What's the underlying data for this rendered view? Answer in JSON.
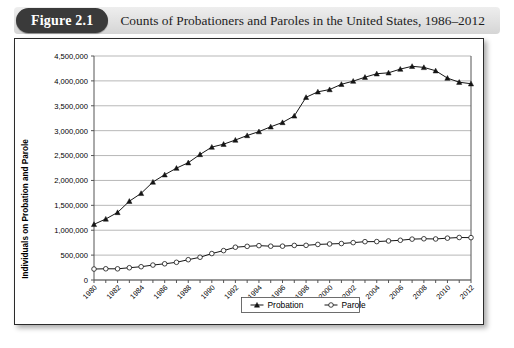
{
  "figure": {
    "badge_label": "Figure 2.1",
    "title": "Counts of Probationers and Paroles in the United States, 1986–2012"
  },
  "chart_data": {
    "type": "line",
    "xlabel": "",
    "ylabel": "Individuals on Probation and Parole",
    "ylim": [
      0,
      4500000
    ],
    "xlim": [
      1980,
      2012
    ],
    "grid": true,
    "legend_position": "bottom-center",
    "y_tick_labels": [
      "0",
      "500,000",
      "1,000,000",
      "1,500,000",
      "2,000,000",
      "2,500,000",
      "3,000,000",
      "3,500,000",
      "4,000,000",
      "4,500,000"
    ],
    "y_ticks": [
      0,
      500000,
      1000000,
      1500000,
      2000000,
      2500000,
      3000000,
      3500000,
      4000000,
      4500000
    ],
    "x": [
      1980,
      1981,
      1982,
      1983,
      1984,
      1985,
      1986,
      1987,
      1988,
      1989,
      1990,
      1991,
      1992,
      1993,
      1994,
      1995,
      1996,
      1997,
      1998,
      1999,
      2000,
      2001,
      2002,
      2003,
      2004,
      2005,
      2006,
      2007,
      2008,
      2009,
      2010,
      2011,
      2012
    ],
    "x_tick_labels": [
      "1980",
      "1982",
      "1984",
      "1986",
      "1988",
      "1990",
      "1992",
      "1994",
      "1996",
      "1998",
      "2000",
      "2002",
      "2004",
      "2006",
      "2008",
      "2010",
      "2012"
    ],
    "series": [
      {
        "name": "Probation",
        "marker": "filled-triangle",
        "values": [
          1118097,
          1225934,
          1357264,
          1582947,
          1740948,
          1968712,
          2114621,
          2247158,
          2356483,
          2522125,
          2670234,
          2728472,
          2811611,
          2903061,
          2981022,
          3077861,
          3164996,
          3296513,
          3670441,
          3779922,
          3826209,
          3931731,
          3995165,
          4073987,
          4143792,
          4162536,
          4236800,
          4293163,
          4270917,
          4203967,
          4055514,
          3973800,
          3942800
        ]
      },
      {
        "name": "Parole",
        "marker": "open-circle",
        "values": [
          220438,
          225539,
          224604,
          246440,
          266992,
          300203,
          325638,
          355505,
          407977,
          456803,
          531407,
          590442,
          658601,
          676100,
          690371,
          679421,
          679733,
          694787,
          696385,
          714457,
          723898,
          732333,
          750934,
          769925,
          771852,
          784408,
          798202,
          821177,
          828169,
          824365,
          840676,
          853852,
          851200
        ]
      }
    ],
    "legend": [
      {
        "label": "Probation",
        "marker": "filled-triangle"
      },
      {
        "label": "Parole",
        "marker": "open-circle"
      }
    ]
  }
}
